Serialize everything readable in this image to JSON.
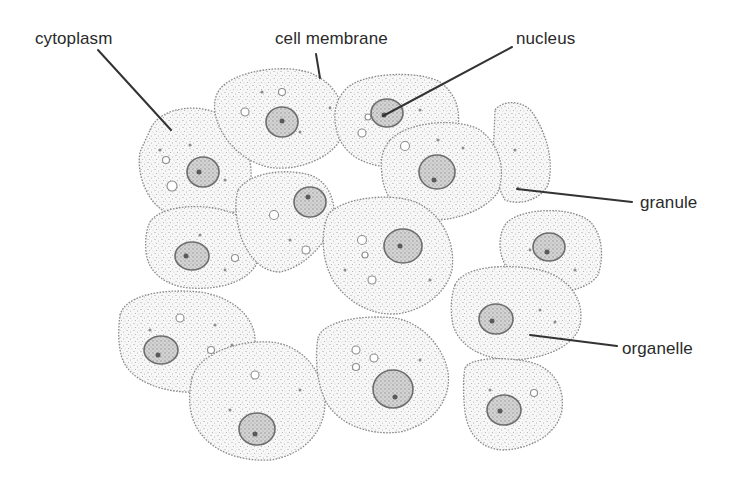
{
  "diagram": {
    "labels": {
      "cytoplasm": "cytoplasm",
      "cell_membrane": "cell membrane",
      "nucleus": "nucleus",
      "granule": "granule",
      "organelle": "organelle"
    },
    "colors": {
      "background": "#ffffff",
      "label_text": "#2a2a2a",
      "leader_line": "#333333",
      "cell_outline": "#8a8a8a",
      "nucleus_outline": "#6d6d6d"
    }
  }
}
